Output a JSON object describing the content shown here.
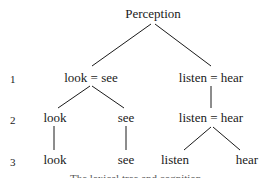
{
  "diagram": {
    "type": "tree",
    "root": {
      "id": "perception",
      "label": "Perception"
    },
    "levels": [
      {
        "number": "1",
        "nodes": [
          {
            "id": "l1-look-see",
            "label": "look = see",
            "parent": "perception"
          },
          {
            "id": "l1-listen-hear",
            "label": "listen = hear",
            "parent": "perception"
          }
        ]
      },
      {
        "number": "2",
        "nodes": [
          {
            "id": "l2-look",
            "label": "look",
            "parent": "l1-look-see"
          },
          {
            "id": "l2-see",
            "label": "see",
            "parent": "l1-look-see"
          },
          {
            "id": "l2-listen-hear",
            "label": "listen = hear",
            "parent": "l1-listen-hear"
          }
        ]
      },
      {
        "number": "3",
        "nodes": [
          {
            "id": "l3-look",
            "label": "look",
            "parent": "l2-look"
          },
          {
            "id": "l3-see",
            "label": "see",
            "parent": "l2-see"
          },
          {
            "id": "l3-listen",
            "label": "listen",
            "parent": "l2-listen-hear"
          },
          {
            "id": "l3-hear",
            "label": "hear",
            "parent": "l2-listen-hear"
          }
        ]
      }
    ],
    "caption_clipped": "The lexical tree and cognition"
  }
}
